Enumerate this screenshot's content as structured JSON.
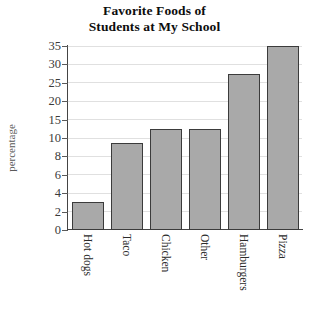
{
  "chart_data": {
    "type": "bar",
    "title": "Favorite Foods of Students at My School",
    "title_lines": [
      "Favorite Foods of",
      "Students at My School"
    ],
    "xlabel": "",
    "ylabel": "percentage",
    "categories": [
      "Hot dogs",
      "Taco",
      "Chicken",
      "Other",
      "Hamburgers",
      "Pizza"
    ],
    "values": [
      3,
      9.5,
      12.5,
      12.5,
      27.5,
      35
    ],
    "ytick_labels": [
      "0",
      "2",
      "4",
      "6",
      "8",
      "10",
      "15",
      "20",
      "25",
      "30",
      "35"
    ],
    "ytick_values": [
      0,
      2,
      4,
      6,
      8,
      10,
      15,
      20,
      25,
      30,
      35
    ],
    "ylim": [
      0,
      35
    ],
    "y_axis_scale": "piecewise-linear: equal spacing per tick (0-10 by 2, 10-35 by 5)",
    "grid": true,
    "legend": false,
    "bar_fill_color": "#a9a9a9",
    "bar_border_color": "#3b3b3b",
    "gridline_color": "#e0e0e0",
    "axis_color": "#444444"
  }
}
